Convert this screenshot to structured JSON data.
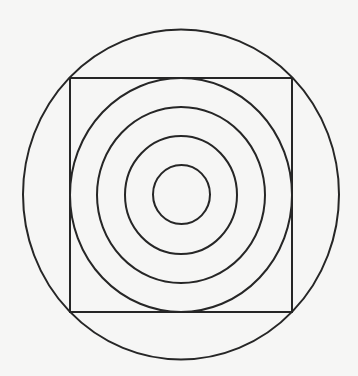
{
  "diagram": {
    "background": "#f6f6f5",
    "stroke_color": "#262626",
    "stroke_width": 2,
    "outer_circle": {
      "cx": 181,
      "cy": 194.5,
      "rx": 158,
      "ry": 165
    },
    "square": {
      "x": 70,
      "y": 78,
      "width": 222,
      "height": 234
    },
    "concentric_rings": [
      {
        "cx": 181,
        "cy": 195,
        "rx": 111,
        "ry": 117
      },
      {
        "cx": 181,
        "cy": 195,
        "rx": 84,
        "ry": 88
      },
      {
        "cx": 181,
        "cy": 195,
        "rx": 56,
        "ry": 59
      },
      {
        "cx": 181.5,
        "cy": 194.5,
        "rx": 28.5,
        "ry": 29.5
      }
    ]
  }
}
